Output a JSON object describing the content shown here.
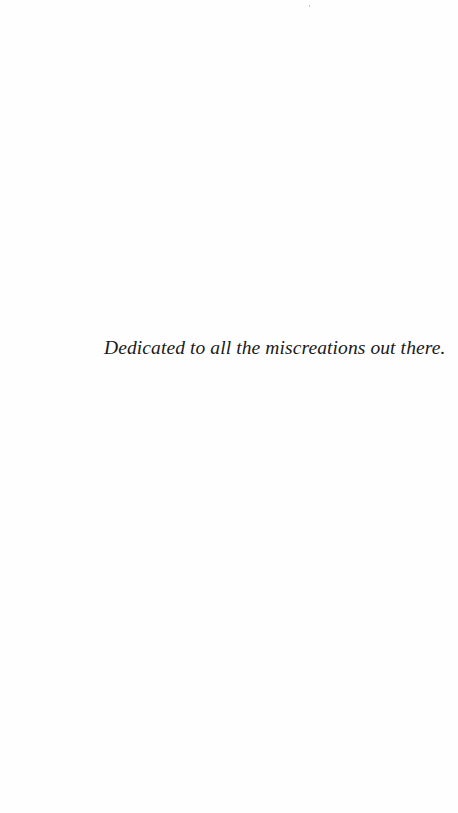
{
  "page": {
    "type": "dedication-page",
    "background_color": "#fefefe",
    "text_color": "#1a1a1a"
  },
  "dedication": {
    "text": "Dedicated to all the miscreations out there."
  }
}
